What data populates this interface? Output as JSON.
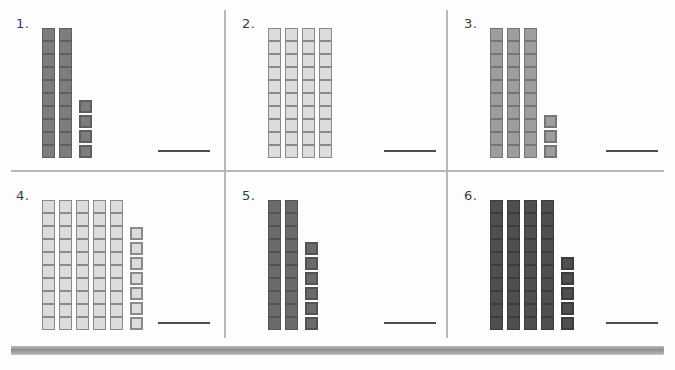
{
  "worksheet": {
    "title": "Base-Ten Blocks Place Value Worksheet",
    "background_color": "#fdfdfd",
    "grid_line_color": "#b9b9b9",
    "answer_line_color": "#4d4d4d",
    "bottom_bar_color": "#9d9d9d",
    "rod_length": 10
  },
  "panels": [
    {
      "number_label": "1.",
      "tens_rods": 2,
      "ones_cubes": 4,
      "total_value": 24,
      "block_fill_color": "#7d7d7d",
      "block_border_color": "#5e5e5e",
      "answer_value": ""
    },
    {
      "number_label": "2.",
      "tens_rods": 4,
      "ones_cubes": 0,
      "total_value": 40,
      "block_fill_color": "#dcdcdc",
      "block_border_color": "#8a8a8a",
      "answer_value": ""
    },
    {
      "number_label": "3.",
      "tens_rods": 3,
      "ones_cubes": 3,
      "total_value": 33,
      "block_fill_color": "#9d9d9d",
      "block_border_color": "#757575",
      "answer_value": ""
    },
    {
      "number_label": "4.",
      "tens_rods": 5,
      "ones_cubes": 7,
      "total_value": 57,
      "block_fill_color": "#dcdcdc",
      "block_border_color": "#8a8a8a",
      "answer_value": ""
    },
    {
      "number_label": "5.",
      "tens_rods": 2,
      "ones_cubes": 6,
      "total_value": 26,
      "block_fill_color": "#6b6b6b",
      "block_border_color": "#525252",
      "answer_value": ""
    },
    {
      "number_label": "6.",
      "tens_rods": 4,
      "ones_cubes": 5,
      "total_value": 45,
      "block_fill_color": "#4f4f4f",
      "block_border_color": "#3c3c3c",
      "answer_value": ""
    }
  ]
}
